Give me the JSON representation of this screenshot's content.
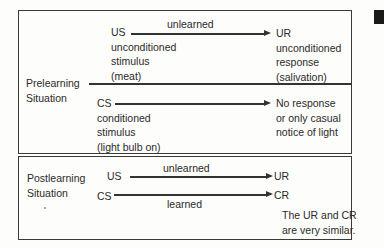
{
  "prelearning": {
    "section_label_1": "Prelearning",
    "section_label_2": "Situation",
    "us": {
      "abbr": "US",
      "line1": "unconditioned",
      "line2": "stimulus",
      "line3": "(meat)"
    },
    "us_arrow_label": "unlearned",
    "ur": {
      "abbr": "UR",
      "line1": "unconditioned",
      "line2": "response",
      "line3": "(salivation)"
    },
    "cs": {
      "abbr": "CS",
      "line1": "conditioned",
      "line2": "stimulus",
      "line3": "(light bulb on)"
    },
    "cs_result": {
      "line1": "No response",
      "line2": "or only casual",
      "line3": "notice of light"
    }
  },
  "postlearning": {
    "section_label_1": "Postlearning",
    "section_label_2": "Situation",
    "us_abbr": "US",
    "us_arrow_label": "unlearned",
    "ur_abbr": "UR",
    "cs_abbr": "CS",
    "cs_arrow_label": "learned",
    "cr_abbr": "CR",
    "note_line1": "The UR and CR",
    "note_line2": "are very similar."
  },
  "colors": {
    "line": "#333333",
    "text": "#2a2a2a",
    "background": "#fdfdfb"
  }
}
